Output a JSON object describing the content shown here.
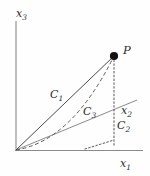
{
  "figure": {
    "background_color": "#fefefe",
    "line_color": "#4a4a4a",
    "axis_color": "#8a8a8a",
    "point_color": "#111111"
  },
  "axes": [
    {
      "name": "x3",
      "base": "x",
      "subscript": "3",
      "label_x": 16,
      "label_y": 16,
      "orientation": "vertical-up"
    },
    {
      "name": "x1",
      "base": "x",
      "subscript": "1",
      "label_x": 120,
      "label_y": 166,
      "orientation": "horizontal-right"
    },
    {
      "name": "x2",
      "base": "x",
      "subscript": "2",
      "label_x": 122,
      "label_y": 113,
      "orientation": "diagonal-up-right"
    }
  ],
  "point": {
    "name": "P",
    "label": "P",
    "label_x": 124,
    "label_y": 52,
    "cx": 114,
    "cy": 56,
    "r": 4.1
  },
  "paths": [
    {
      "name": "C1",
      "base": "C",
      "subscript": "1",
      "style": "solid",
      "label_x": 52,
      "label_y": 97
    },
    {
      "name": "C3",
      "base": "C",
      "subscript": "3",
      "style": "dashed",
      "label_x": 84,
      "label_y": 113
    },
    {
      "name": "C2",
      "base": "C",
      "subscript": "2",
      "style": "solid",
      "label_x": 118,
      "label_y": 128
    }
  ],
  "geometry": {
    "origin_x": 16,
    "origin_y": 150,
    "x3_axis_top_y": 21,
    "x1_axis_right_x": 143,
    "x2_axis_end_x": 137,
    "x2_axis_end_y": 100,
    "projection_foot_x": 114,
    "projection_foot_y": 140,
    "x1_foot_x": 85,
    "x1_foot_y": 149
  }
}
